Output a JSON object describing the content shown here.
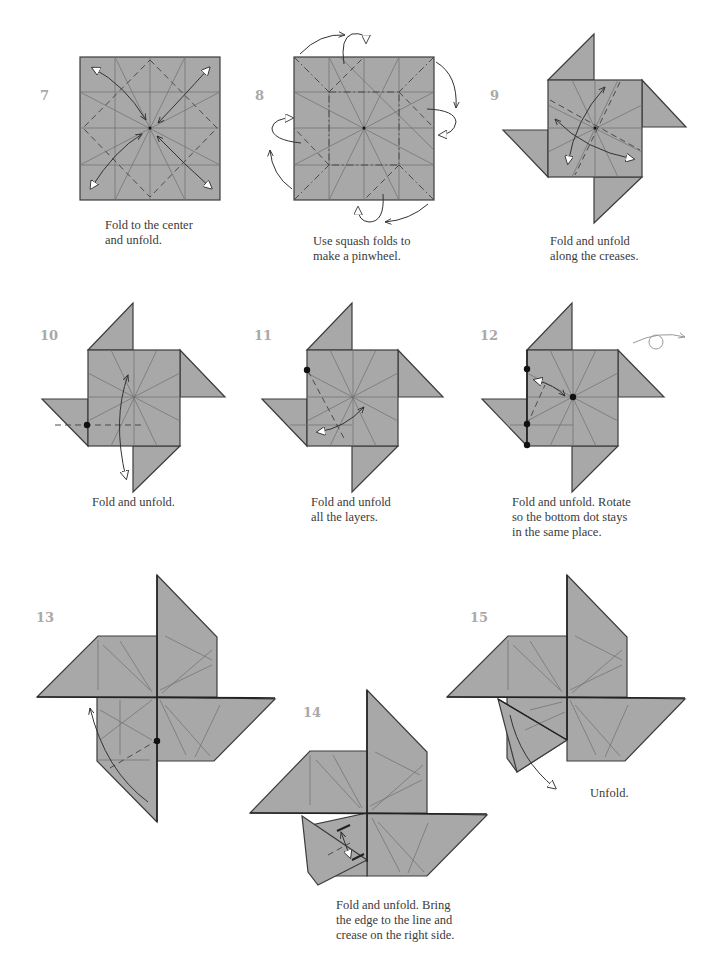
{
  "page": {
    "type": "origami-instructions",
    "paper_color": "#a8a8a8",
    "edge_color": "#3c3c3c",
    "step_number_color": "#a9a9a9"
  },
  "steps": [
    {
      "number": "7",
      "caption": "Fold to the center\nand unfold."
    },
    {
      "number": "8",
      "caption": "Use squash folds to\nmake a pinwheel."
    },
    {
      "number": "9",
      "caption": "Fold and unfold\nalong the creases."
    },
    {
      "number": "10",
      "caption": "Fold and unfold."
    },
    {
      "number": "11",
      "caption": "Fold and unfold\nall the layers."
    },
    {
      "number": "12",
      "caption": "Fold and unfold. Rotate\nso the bottom dot stays\nin the same place."
    },
    {
      "number": "13",
      "caption": ""
    },
    {
      "number": "14",
      "caption": "Fold and unfold. Bring\nthe edge to the line and\ncrease on the right side."
    },
    {
      "number": "15",
      "caption": "Unfold."
    }
  ],
  "icons": {
    "fold_unfold_arrow": "double-headed-arrow",
    "squash_arrow": "curved-arrow",
    "rotate_symbol": "rotate-over-icon",
    "reference_dot": "dot"
  }
}
